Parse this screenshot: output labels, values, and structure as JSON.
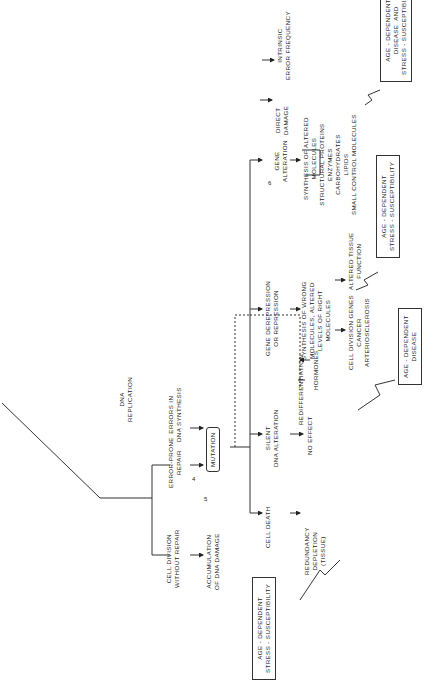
{
  "diagram": {
    "root": "DNA\nREPLICATION",
    "branches": {
      "cell_division_without_repair": "CELL DIVISION\nWITHOUT REPAIR",
      "error_prone_repair": "ERROR-PRONE\nREPAIR",
      "errors_in_dna_synthesis": "ERRORS IN\nDNA SYNTHESIS"
    },
    "accumulation": "ACCUMULATION\nOF DNA DAMAGE",
    "mutation": "MUTATION",
    "markers": {
      "m4": "4",
      "m5": "5",
      "m6": "6"
    },
    "outcomes": {
      "cell_death": "CELL DEATH",
      "redundancy": "REDUNDANCY\nDEPLETION\n(TISSUE)",
      "silent": "SILENT\nDNA ALTERATION",
      "no_effect": "NO EFFECT",
      "redifferentiation": "REDIFFERENTIATION",
      "hormones": "HORMONES",
      "gene_derepression": "GENE DEREPRESSION\nOR REPRESSION",
      "synthesis_wrong": "SYNTHESIS OF WRONG\nMOLECULES, ALTERED\nLEVELS OF RIGHT\nMOLECULES",
      "cell_division_genes": "CELL DIVISION GENES\nCANCER\nARTERIOSCLEROSIS",
      "altered_tissue": "ALTERED TISSUE\nFUNCTION",
      "gene_alteration": "GENE\nALTERATION",
      "synthesis_altered": "SYNTHESIS OF ALTERED\nMOLECULES",
      "molecule_list": "STRUCTURAL PROTEINS\nENZYMES\nCARBOHYDRATES\nLIPIDS\nSMALL CONTROL MOLECULES",
      "direct_damage": "DIRECT\nDAMAGE",
      "intrinsic": "INTRINSIC\nERROR FREQUENCY"
    },
    "boxes": {
      "stress_bottom": "AGE - DEPENDENT\nSTRESS - SUSCEPTIBILITY",
      "disease_mid": "AGE - DEPENDENT\nDISEASE",
      "stress_mid": "AGE - DEPENDENT\nSTRESS - SUSCEPTIBILITY",
      "disease_and_stress_top": "AGE - DEPENDENT\nDISEASE  AND\nSTRESS - SUSCEPTIBILITY"
    }
  }
}
